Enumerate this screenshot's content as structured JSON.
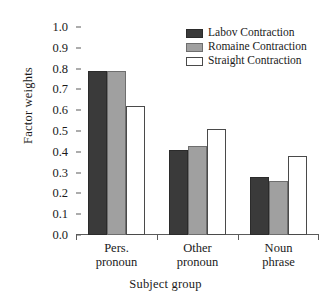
{
  "chart_data": {
    "type": "bar",
    "title": "",
    "xlabel": "Subject group",
    "ylabel": "Factor weights",
    "categories": [
      "Pers.\npronoun",
      "Other\npronoun",
      "Noun\nphrase"
    ],
    "category_lines": [
      [
        "Pers.",
        "pronoun"
      ],
      [
        "Other",
        "pronoun"
      ],
      [
        "Noun",
        "phrase"
      ]
    ],
    "series": [
      {
        "name": "Labov Contraction",
        "color": "#3a3a3a",
        "values": [
          0.79,
          0.41,
          0.28
        ]
      },
      {
        "name": "Romaine Contraction",
        "color": "#a0a0a0",
        "values": [
          0.79,
          0.43,
          0.26
        ]
      },
      {
        "name": "Straight Contraction",
        "color": "#ffffff",
        "values": [
          0.62,
          0.51,
          0.38
        ]
      }
    ],
    "ylim": [
      0.0,
      1.0
    ],
    "yticks": [
      "1.0",
      "0.9",
      "0.8",
      "0.7",
      "0.6",
      "0.5",
      "0.4",
      "0.3",
      "0.2",
      "0.1",
      "0.0"
    ],
    "ytick_values": [
      1.0,
      0.9,
      0.8,
      0.7,
      0.6,
      0.5,
      0.4,
      0.3,
      0.2,
      0.1,
      0.0
    ],
    "grid": false,
    "legend_position": "top-right"
  },
  "legend": {
    "entries": [
      {
        "label": "Labov Contraction",
        "swatch": "labov"
      },
      {
        "label": "Romaine Contraction",
        "swatch": "romaine"
      },
      {
        "label": "Straight Contraction",
        "swatch": "straight"
      }
    ]
  },
  "colors": {
    "labov": "#3a3a3a",
    "romaine": "#a0a0a0",
    "straight": "#ffffff",
    "axis": "#5a5a5a",
    "text": "#1a1a1a",
    "background": "#ffffff"
  }
}
